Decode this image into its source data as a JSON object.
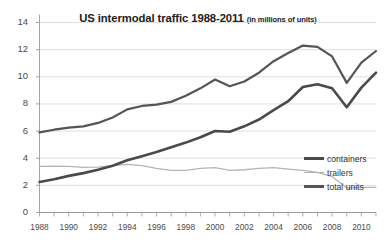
{
  "chart_data": {
    "type": "line",
    "title": "US intermodal traffic 1988-2011",
    "subtitle": "(in millions of units)",
    "xlabel": "",
    "ylabel": "",
    "grid": true,
    "legend_position": "right",
    "xlim": [
      1988,
      2011
    ],
    "ylim": [
      0,
      14
    ],
    "ytick_step": 2,
    "x": [
      1988,
      1989,
      1990,
      1991,
      1992,
      1993,
      1994,
      1995,
      1996,
      1997,
      1998,
      1999,
      2000,
      2001,
      2002,
      2003,
      2004,
      2005,
      2006,
      2007,
      2008,
      2009,
      2010,
      2011
    ],
    "xtick_labels": [
      "1988",
      "1990",
      "1992",
      "1994",
      "1996",
      "1998",
      "2000",
      "2002",
      "2004",
      "2006",
      "2010"
    ],
    "xticks": [
      1988,
      1990,
      1992,
      1994,
      1996,
      1998,
      2000,
      2002,
      2004,
      2006,
      2008,
      2010
    ],
    "ytick_labels": [
      "0",
      "2",
      "4",
      "6",
      "8",
      "10",
      "12",
      "14"
    ],
    "series": [
      {
        "name": "containers",
        "color": "#4a4a4a",
        "width": 2.6,
        "values": [
          2.25,
          2.45,
          2.7,
          2.9,
          3.15,
          3.45,
          3.85,
          4.15,
          4.45,
          4.8,
          5.15,
          5.55,
          6.0,
          5.95,
          6.35,
          6.85,
          7.55,
          8.2,
          9.25,
          9.45,
          9.15,
          7.75,
          9.2,
          10.3
        ]
      },
      {
        "name": "trailers",
        "color": "#b5b5b5",
        "width": 1.3,
        "values": [
          3.4,
          3.42,
          3.4,
          3.32,
          3.35,
          3.45,
          3.55,
          3.45,
          3.25,
          3.1,
          3.1,
          3.25,
          3.3,
          3.1,
          3.15,
          3.25,
          3.3,
          3.2,
          3.1,
          2.95,
          2.65,
          1.8,
          1.85,
          1.85
        ]
      },
      {
        "name": "total units",
        "color": "#555555",
        "width": 2.2,
        "values": [
          5.9,
          6.1,
          6.25,
          6.35,
          6.6,
          7.0,
          7.6,
          7.85,
          7.95,
          8.15,
          8.6,
          9.15,
          9.8,
          9.3,
          9.65,
          10.3,
          11.15,
          11.75,
          12.3,
          12.2,
          11.5,
          9.55,
          11.05,
          11.9
        ]
      }
    ]
  },
  "legend": {
    "items": [
      {
        "label": "containers"
      },
      {
        "label": "trailers"
      },
      {
        "label": "total units"
      }
    ]
  }
}
